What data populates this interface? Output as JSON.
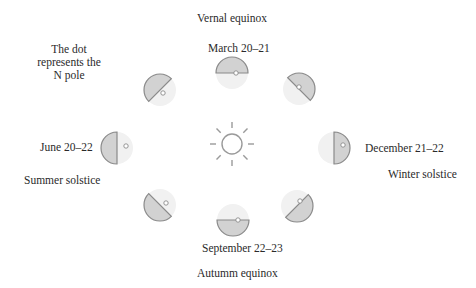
{
  "labels": {
    "vernal_equinox": "Vernal equinox",
    "march": "March 20–21",
    "note_line1": "The dot",
    "note_line2": "represents the",
    "note_line3": "N pole",
    "june": "June 20–22",
    "summer_solstice": "Summer solstice",
    "december": "December 21–22",
    "winter_solstice": "Winter solstice",
    "september": "September 22–23",
    "autumn_equinox": "Autumm equinox"
  },
  "colors": {
    "dark_half": "#d2d2d2",
    "light_half": "#f1f1f1",
    "outline": "#8a8a8a",
    "sun_stroke": "#9a9a9a"
  },
  "earths": [
    {
      "id": "march",
      "cx": 232,
      "cy": 72,
      "dark_angle": 0
    },
    {
      "id": "top-right",
      "cx": 300,
      "cy": 88,
      "dark_angle": 45
    },
    {
      "id": "december",
      "cx": 334,
      "cy": 148,
      "dark_angle": 90
    },
    {
      "id": "bottom-right",
      "cx": 300,
      "cy": 206,
      "dark_angle": 135
    },
    {
      "id": "september",
      "cx": 232,
      "cy": 222,
      "dark_angle": 180
    },
    {
      "id": "bottom-left",
      "cx": 160,
      "cy": 205,
      "dark_angle": 225
    },
    {
      "id": "june",
      "cx": 116,
      "cy": 148,
      "dark_angle": 270
    },
    {
      "id": "top-left",
      "cx": 160,
      "cy": 90,
      "dark_angle": 315
    }
  ]
}
